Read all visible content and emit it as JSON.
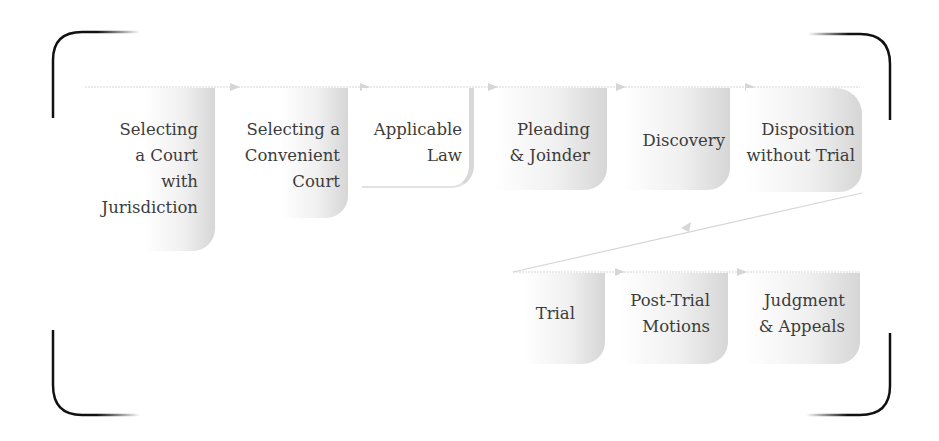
{
  "diagram": {
    "title": "",
    "colors": {
      "frame": "#111111",
      "connector": "#d6d6d6",
      "box_shade_dark": "#d6d6d6",
      "box_shade_light": "#ffffff",
      "text": "#3c3c3c"
    },
    "row1_steps": [
      {
        "label": "Selecting\na Court\nwith\nJurisdiction"
      },
      {
        "label": "Selecting a\nConvenient\nCourt"
      },
      {
        "label": "Applicable\nLaw"
      },
      {
        "label": "Pleading\n& Joinder"
      },
      {
        "label": "Discovery"
      },
      {
        "label": "Disposition\nwithout Trial"
      }
    ],
    "row2_steps": [
      {
        "label": "Trial"
      },
      {
        "label": "Post-Trial\nMotions"
      },
      {
        "label": "Judgment\n& Appeals"
      }
    ],
    "frame_icons": {
      "top_left": "bracket-corner-top-left",
      "top_right": "bracket-corner-top-right",
      "bottom_left": "bracket-corner-bottom-left",
      "bottom_right": "bracket-corner-bottom-right"
    }
  }
}
